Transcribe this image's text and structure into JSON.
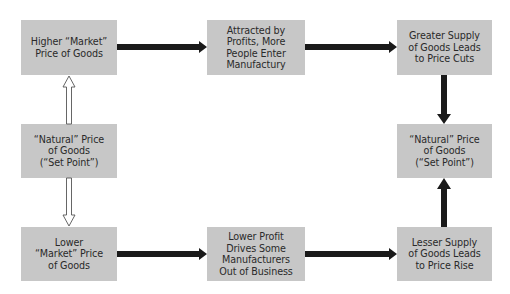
{
  "diagram": {
    "type": "flow",
    "nodes": {
      "higher_market": {
        "label": "Higher “Market”\nPrice of Goods"
      },
      "natural_left": {
        "label": "“Natural” Price\nof Goods\n(“Set Point”)"
      },
      "lower_market": {
        "label": "Lower\n“Market” Price\nof Goods"
      },
      "attracted": {
        "label": "Attracted by\nProfits, More\nPeople Enter\nManufactury"
      },
      "lower_profit": {
        "label": "Lower Profit\nDrives Some\nManufacturers\nOut of Business"
      },
      "greater_supply": {
        "label": "Greater Supply\nof Goods Leads\nto Price Cuts"
      },
      "natural_right": {
        "label": "“Natural” Price\nof Goods\n(“Set Point”)"
      },
      "lesser_supply": {
        "label": "Lesser Supply\nof Goods Leads\nto Price Rise"
      }
    },
    "edges": [
      {
        "from": "natural_left",
        "to": "higher_market",
        "style": "hollow"
      },
      {
        "from": "natural_left",
        "to": "lower_market",
        "style": "hollow"
      },
      {
        "from": "higher_market",
        "to": "attracted",
        "style": "solid"
      },
      {
        "from": "attracted",
        "to": "greater_supply",
        "style": "solid"
      },
      {
        "from": "greater_supply",
        "to": "natural_right",
        "style": "solid"
      },
      {
        "from": "lower_market",
        "to": "lower_profit",
        "style": "solid"
      },
      {
        "from": "lower_profit",
        "to": "lesser_supply",
        "style": "solid"
      },
      {
        "from": "lesser_supply",
        "to": "natural_right",
        "style": "solid"
      }
    ],
    "colors": {
      "box_fill": "#c7c7c7",
      "text": "#2a2a2a",
      "solid_arrow": "#1a1a1a",
      "hollow_arrow_stroke": "#555555",
      "background": "#ffffff"
    }
  }
}
